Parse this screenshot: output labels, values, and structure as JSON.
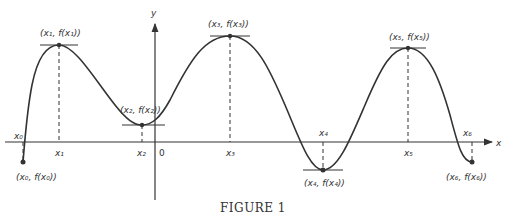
{
  "figure": {
    "caption": "FIGURE 1",
    "axes": {
      "x_label": "x",
      "y_label": "y",
      "origin_label": "0"
    },
    "points": [
      {
        "name": "x0",
        "tick_label": "x₀",
        "point_label": "(x₀, f(x₀))",
        "kind": "endpoint"
      },
      {
        "name": "x1",
        "tick_label": "x₁",
        "point_label": "(x₁, f(x₁))",
        "kind": "local-max"
      },
      {
        "name": "x2",
        "tick_label": "x₂",
        "point_label": "(x₂, f(x₂))",
        "kind": "local-min"
      },
      {
        "name": "x3",
        "tick_label": "x₃",
        "point_label": "(x₃, f(x₃))",
        "kind": "local-max"
      },
      {
        "name": "x4",
        "tick_label": "x₄",
        "point_label": "(x₄, f(x₄))",
        "kind": "local-min"
      },
      {
        "name": "x5",
        "tick_label": "x₅",
        "point_label": "(x₅, f(x₅))",
        "kind": "local-max"
      },
      {
        "name": "x6",
        "tick_label": "x₆",
        "point_label": "(x₆, f(x₆))",
        "kind": "endpoint"
      }
    ]
  }
}
